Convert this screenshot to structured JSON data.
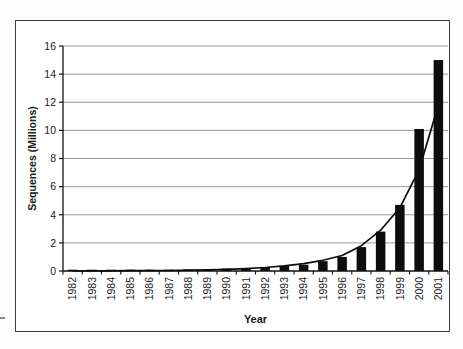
{
  "page": {
    "background_color": "#fdfdfd",
    "chart_frame_border_color": "#3c3c3c",
    "left_edge_mark": "-"
  },
  "chart_data": {
    "type": "bar",
    "title": "",
    "xlabel": "Year",
    "ylabel": "Sequences (Millions)",
    "categories": [
      "1982",
      "1983",
      "1984",
      "1985",
      "1986",
      "1987",
      "1988",
      "1989",
      "1990",
      "1991",
      "1992",
      "1993",
      "1994",
      "1995",
      "1996",
      "1997",
      "1998",
      "1999",
      "2000",
      "2001"
    ],
    "series": [
      {
        "name": "Sequences (Millions)",
        "type": "bar",
        "color": "#0d0d0d",
        "values": [
          0.01,
          0.02,
          0.03,
          0.04,
          0.06,
          0.08,
          0.1,
          0.13,
          0.17,
          0.21,
          0.27,
          0.35,
          0.45,
          0.7,
          1.0,
          1.7,
          2.8,
          4.7,
          10.1,
          15.0
        ]
      },
      {
        "name": "Exponential trend line",
        "type": "line",
        "color": "#0d0d0d",
        "values": [
          0.005,
          0.008,
          0.012,
          0.018,
          0.026,
          0.038,
          0.055,
          0.08,
          0.12,
          0.17,
          0.25,
          0.36,
          0.52,
          0.76,
          1.1,
          1.8,
          2.9,
          4.5,
          7.2,
          11.8
        ]
      }
    ],
    "ylim": [
      0,
      16
    ],
    "yticks": [
      0,
      2,
      4,
      6,
      8,
      10,
      12,
      14,
      16
    ],
    "grid": true,
    "gridline_color": "#9a9a9a",
    "axis_color": "#111111",
    "legend": "none",
    "x_tick_label_rotation": -90,
    "plot_background": "#ffffff"
  }
}
